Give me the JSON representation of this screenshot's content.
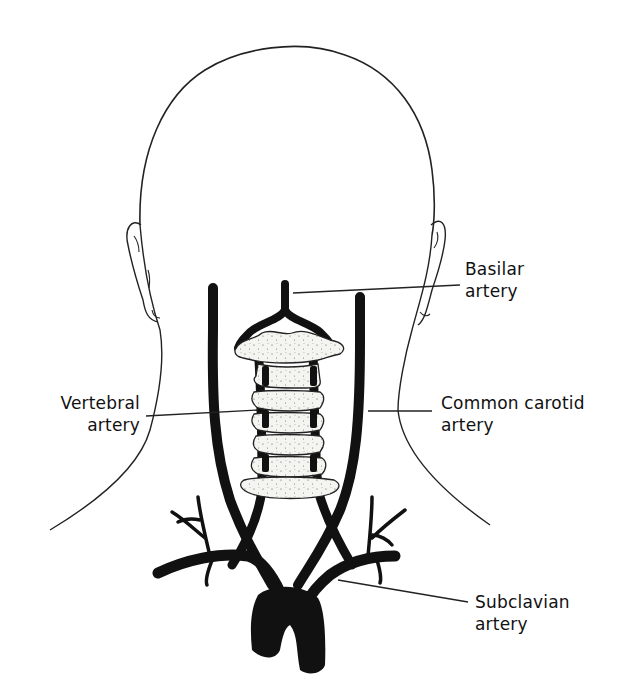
{
  "figure": {
    "colors": {
      "ink": "#111111",
      "background": "#ffffff",
      "bone_fill": "#f2f2ee"
    }
  },
  "labels": {
    "basilar": {
      "line1": "Basilar",
      "line2": "artery"
    },
    "vertebral": {
      "line1": "Vertebral",
      "line2": "artery"
    },
    "common_carotid": {
      "line1": "Common carotid",
      "line2": "artery"
    },
    "subclavian": {
      "line1": "Subclavian",
      "line2": "artery"
    }
  }
}
